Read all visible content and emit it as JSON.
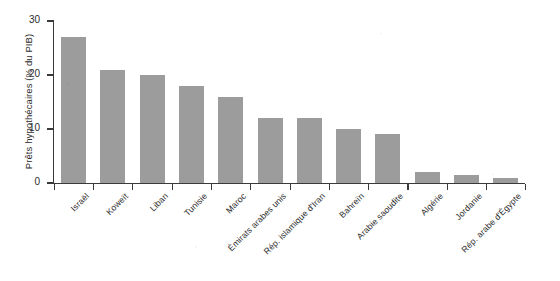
{
  "chart_data": {
    "type": "bar",
    "title": "",
    "xlabel": "",
    "ylabel": "Prêts hypothécaires (% du PIB)",
    "ylim": [
      0,
      30
    ],
    "yticks": [
      0,
      10,
      20,
      30
    ],
    "grid": false,
    "legend": null,
    "bar_color": "#9c9c9c",
    "axis_color": "#3a3a3a",
    "background": "#ffffff",
    "categories": [
      "Israël",
      "Koweït",
      "Liban",
      "Tunisie",
      "Maroc",
      "Émirats arabes unis",
      "Rép. islamique d'Iran",
      "Bahreïn",
      "Arabie saoudite",
      "Algérie",
      "Jordanie",
      "Rép. arabe d'Égypte"
    ],
    "values": [
      27,
      21,
      20,
      18,
      16,
      12,
      12,
      10,
      9,
      2,
      1.5,
      1
    ]
  }
}
